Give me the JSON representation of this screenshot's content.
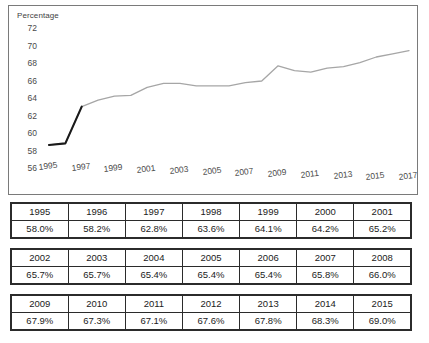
{
  "chart": {
    "axis_title": "Percentage",
    "y_ticks": [
      "72",
      "70",
      "68",
      "66",
      "64",
      "62",
      "60",
      "58",
      "56"
    ],
    "x_ticks": [
      "1995",
      "1997",
      "1999",
      "2001",
      "2003",
      "2005",
      "2007",
      "2009",
      "2011",
      "2013",
      "2015",
      "2017"
    ],
    "line_color": "#a6a6a6",
    "highlight_color": "#1a1a1a",
    "border_color": "#7a7a7a"
  },
  "chart_data": {
    "type": "line",
    "title": "",
    "subtitle": "",
    "xlabel": "",
    "ylabel": "Percentage",
    "ylim": [
      56,
      72
    ],
    "xlim": [
      1995,
      2017
    ],
    "grid": false,
    "legend": "none",
    "categories": [
      1995,
      1996,
      1997,
      1998,
      1999,
      2000,
      2001,
      2002,
      2003,
      2004,
      2005,
      2006,
      2007,
      2008,
      2009,
      2010,
      2011,
      2012,
      2013,
      2014,
      2015,
      2016,
      2017
    ],
    "series": [
      {
        "name": "Percentage",
        "values": [
          58.0,
          58.2,
          62.8,
          63.6,
          64.1,
          64.2,
          65.2,
          65.7,
          65.7,
          65.4,
          65.4,
          65.4,
          65.8,
          66.0,
          67.9,
          67.3,
          67.1,
          67.6,
          67.8,
          68.3,
          69.0,
          69.4,
          69.8
        ]
      }
    ],
    "annotations": [
      {
        "text": "steep rise segment drawn darker",
        "from_x": 1996,
        "to_x": 1997
      }
    ],
    "y_tick_labels": [
      "56",
      "58",
      "60",
      "62",
      "64",
      "66",
      "68",
      "70",
      "72"
    ],
    "x_tick_labels": [
      "1995",
      "1997",
      "1999",
      "2001",
      "2003",
      "2005",
      "2007",
      "2009",
      "2011",
      "2013",
      "2015",
      "2017"
    ]
  },
  "tables": [
    {
      "years": [
        "1995",
        "1996",
        "1997",
        "1998",
        "1999",
        "2000",
        "2001"
      ],
      "values": [
        "58.0%",
        "58.2%",
        "62.8%",
        "63.6%",
        "64.1%",
        "64.2%",
        "65.2%"
      ]
    },
    {
      "years": [
        "2002",
        "2003",
        "2004",
        "2005",
        "2006",
        "2007",
        "2008"
      ],
      "values": [
        "65.7%",
        "65.7%",
        "65.4%",
        "65.4%",
        "65.4%",
        "65.8%",
        "66.0%"
      ]
    },
    {
      "years": [
        "2009",
        "2010",
        "2011",
        "2012",
        "2013",
        "2014",
        "2015"
      ],
      "values": [
        "67.9%",
        "67.3%",
        "67.1%",
        "67.6%",
        "67.8%",
        "68.3%",
        "69.0%"
      ]
    }
  ]
}
